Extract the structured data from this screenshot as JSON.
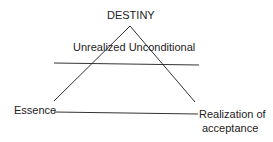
{
  "diagram": {
    "apex_label": "DESTINY",
    "middle_label": "Unrealized Unconditional",
    "left_label": "Essence",
    "right_label_line1": "Realization of",
    "right_label_line2": "acceptance"
  }
}
